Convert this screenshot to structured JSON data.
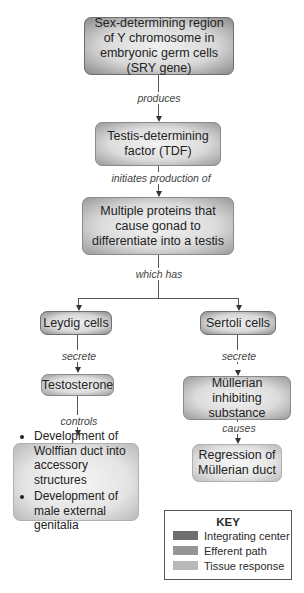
{
  "diagram": {
    "nodes": {
      "sry": "Sex-determining region of Y chromosome in embryonic germ cells (SRY gene)",
      "tdf": "Testis-determining factor (TDF)",
      "proteins": "Multiple proteins that cause gonad to differentiate into a testis",
      "leydig": "Leydig cells",
      "sertoli": "Sertoli cells",
      "testosterone": "Testosterone",
      "mis": "Müllerian inhibiting substance",
      "wolffian_bullets": [
        "Development of Wolffian duct into accessory structures",
        "Development of male external genitalia"
      ],
      "regression": "Regression of Müllerian duct"
    },
    "edges": {
      "produces": "produces",
      "initiates": "initiates production of",
      "which_has": "which has",
      "secrete_left": "secrete",
      "secrete_right": "secrete",
      "controls": "controls",
      "causes": "causes"
    }
  },
  "key": {
    "title": "KEY",
    "items": [
      {
        "label": "Integrating center",
        "color": "#6e6e6e"
      },
      {
        "label": "Efferent path",
        "color": "#959595"
      },
      {
        "label": "Tissue response",
        "color": "#b8b8b8"
      }
    ]
  }
}
